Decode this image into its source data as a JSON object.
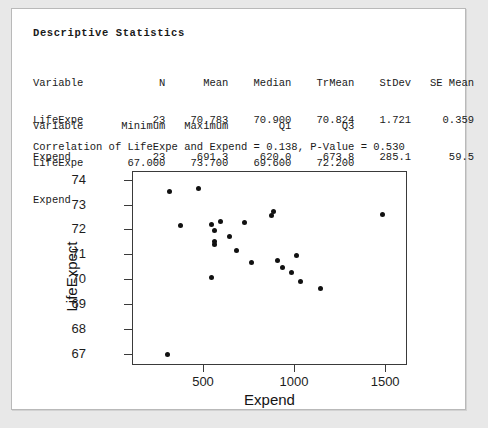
{
  "session": {
    "title": "Descriptive Statistics"
  },
  "table1": {
    "header": "Variable            N      Mean    Median    TrMean    StDev   SE Mean",
    "rows": [
      "LifeExpe           23    70.783    70.900    70.824    1.721     0.359",
      "Expend             23     691.3     620.0     673.8    285.1      59.5"
    ]
  },
  "table2": {
    "header": "Variable      Minimum   Maximum        Q1        Q3",
    "rows": [
      "LifeExpe       67.000    73.700    69.600    72.200",
      "Expend          270.0    1480.0     520.0     880.0"
    ]
  },
  "correlation": {
    "text": "Correlation of LifeExpe and Expend = 0.138, P-Value = 0.530"
  },
  "chart_data": {
    "type": "scatter",
    "title": "",
    "xlabel": "Expend",
    "ylabel": "LifeExpect",
    "xlim": [
      110,
      1620
    ],
    "ylim": [
      66.55,
      74.35
    ],
    "xticks": [
      500,
      1000,
      1500
    ],
    "yticks": [
      67,
      68,
      69,
      70,
      71,
      72,
      73,
      74
    ],
    "grid": false,
    "legend": false,
    "x": [
      310,
      470,
      370,
      560,
      680,
      760,
      870,
      880,
      905,
      980,
      1140,
      540,
      590,
      555,
      560,
      640,
      720,
      540,
      300,
      930,
      1030,
      1480,
      1010
    ],
    "y": [
      73.55,
      73.68,
      72.21,
      71.45,
      71.2,
      70.7,
      72.61,
      72.75,
      70.8,
      70.3,
      69.65,
      72.25,
      72.37,
      72.0,
      71.55,
      71.75,
      72.3,
      70.1,
      67.0,
      70.5,
      69.95,
      72.65,
      71.0
    ],
    "points": [
      {
        "x": 310,
        "y": 73.55
      },
      {
        "x": 470,
        "y": 73.68
      },
      {
        "x": 370,
        "y": 72.21
      },
      {
        "x": 560,
        "y": 71.45
      },
      {
        "x": 680,
        "y": 71.2
      },
      {
        "x": 760,
        "y": 70.7
      },
      {
        "x": 870,
        "y": 72.61
      },
      {
        "x": 880,
        "y": 72.75
      },
      {
        "x": 905,
        "y": 70.8
      },
      {
        "x": 980,
        "y": 70.3
      },
      {
        "x": 1140,
        "y": 69.65
      },
      {
        "x": 540,
        "y": 72.25
      },
      {
        "x": 590,
        "y": 72.37
      },
      {
        "x": 555,
        "y": 72.0
      },
      {
        "x": 560,
        "y": 71.55
      },
      {
        "x": 640,
        "y": 71.75
      },
      {
        "x": 720,
        "y": 72.3
      },
      {
        "x": 540,
        "y": 70.1
      },
      {
        "x": 300,
        "y": 67.0
      },
      {
        "x": 930,
        "y": 70.5
      },
      {
        "x": 1030,
        "y": 69.95
      },
      {
        "x": 1480,
        "y": 72.65
      },
      {
        "x": 1010,
        "y": 71.0
      }
    ]
  }
}
